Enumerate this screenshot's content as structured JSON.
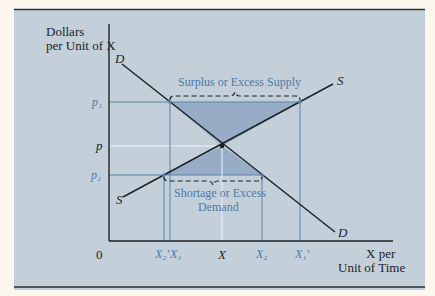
{
  "figure": {
    "y_axis_label": [
      "Dollars",
      "per Unit of X"
    ],
    "x_axis_label": [
      "X per",
      "Unit of Time"
    ],
    "origin_label": "0",
    "curves": {
      "demand": {
        "label_start": "D",
        "label_end": "D"
      },
      "supply": {
        "label_start": "S",
        "label_end": "S"
      }
    },
    "price_labels": {
      "p1": "p₁",
      "p": "p",
      "p2": "p₂"
    },
    "quantity_labels": {
      "x2_prime": "X₂'",
      "x1": "X₁",
      "x": "X",
      "x2": "X₂",
      "x1_prime": "X₁'"
    },
    "annotations": {
      "surplus": "Surplus or Excess Supply",
      "shortage_line1": "Shortage or Excess",
      "shortage_line2": "Demand"
    },
    "colors": {
      "background": "#c3d0d9",
      "shaded_region": "#8fa7c2",
      "guide_lines": "#5b82ad",
      "curves": "#1d2226",
      "label_blue": "#4f7aa6"
    }
  }
}
